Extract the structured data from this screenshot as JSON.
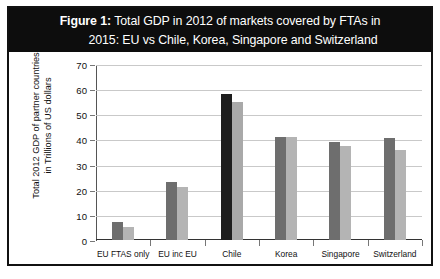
{
  "figure": {
    "label": "Figure 1:",
    "title_line1": "Total GDP in 2012 of markets covered by FTAs in",
    "title_line2": "2015: EU vs Chile, Korea, Singapore and Switzerland",
    "banner_color": "#0d0d0d",
    "banner_text_color": "#ffffff",
    "frame_color": "#111111"
  },
  "chart_data": {
    "type": "bar",
    "title": "Figure 1: Total GDP in 2012 of markets covered by FTAs in 2015: EU vs Chile, Korea, Singapore and Switzerland",
    "xlabel": "",
    "ylabel": "Total 2012 GDP of partner countries in Trillions of US dollars",
    "ylabel_line1": "Total 2012 GDP of partner countries",
    "ylabel_line2": "in Trillions of US dollars",
    "ylim": [
      0,
      70
    ],
    "yticks": [
      0,
      10,
      20,
      30,
      40,
      50,
      60,
      70
    ],
    "ytick_labels": [
      "0",
      "10",
      "20",
      "30",
      "40",
      "50",
      "60",
      "70"
    ],
    "grid": true,
    "legend": "none",
    "categories": [
      "EU FTAS only",
      "EU inc EU",
      "Chile",
      "Korea",
      "Singapore",
      "Switzerland"
    ],
    "series": [
      {
        "name": "Series 1",
        "color": "#6e6e6e",
        "values": [
          7.2,
          23.2,
          58.0,
          41.0,
          38.8,
          40.4
        ]
      },
      {
        "name": "Series 2",
        "color": "#b4b4b4",
        "values": [
          5.2,
          21.2,
          55.0,
          41.0,
          37.2,
          36.0
        ]
      }
    ],
    "highlight": {
      "category": "Chile",
      "series1_color": "#1e1e1e",
      "series2_color": "#a9a9a9"
    }
  },
  "page_text": {
    "cut_off_line": " "
  }
}
